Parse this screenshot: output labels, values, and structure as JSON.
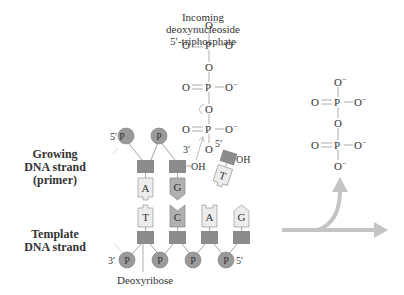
{
  "labels": {
    "incoming": [
      "Incoming",
      "deoxynucleoside",
      "5′-triphosphate"
    ],
    "growing": [
      "Growing",
      "DNA strand",
      "(primer)"
    ],
    "template": [
      "Template",
      "DNA strand"
    ],
    "deoxyribose": "Deoxyribose"
  },
  "strand_ends": {
    "primer_5": "5′",
    "primer_3": "3′",
    "primer_oh": "OH",
    "incoming_5": "5′",
    "incoming_oh": "OH",
    "template_3": "3′",
    "template_5": "5′"
  },
  "phosphate_label": "P",
  "primer_bases": [
    "A",
    "G"
  ],
  "incoming_base": "T",
  "template_bases": [
    "T",
    "C",
    "A",
    "G"
  ],
  "triphosphate": {
    "top": "O⁻",
    "rows": [
      {
        "left": "O",
        "center": "P",
        "right": "O⁻"
      },
      {
        "bridge": "O"
      },
      {
        "left": "O",
        "center": "P",
        "right": "O⁻"
      },
      {
        "bridge": "O"
      },
      {
        "left": "O",
        "center": "P",
        "right": "O⁻"
      },
      {
        "bridge": "O"
      }
    ]
  },
  "pyrophosphate": {
    "top": "O⁻",
    "p1": {
      "left": "O",
      "center": "P",
      "right": "O⁻"
    },
    "bridge": "O",
    "p2": {
      "left": "O",
      "center": "P",
      "right": "O⁻"
    },
    "bottom": "O⁻"
  },
  "colors": {
    "phosphate_fill": "#9a9a9a",
    "sugar_fill": "#8c8c8c",
    "base_light": "#ececec",
    "base_dark": "#a8a8a8",
    "arrow": "#c4c4c4",
    "line": "#9a9a9a"
  }
}
